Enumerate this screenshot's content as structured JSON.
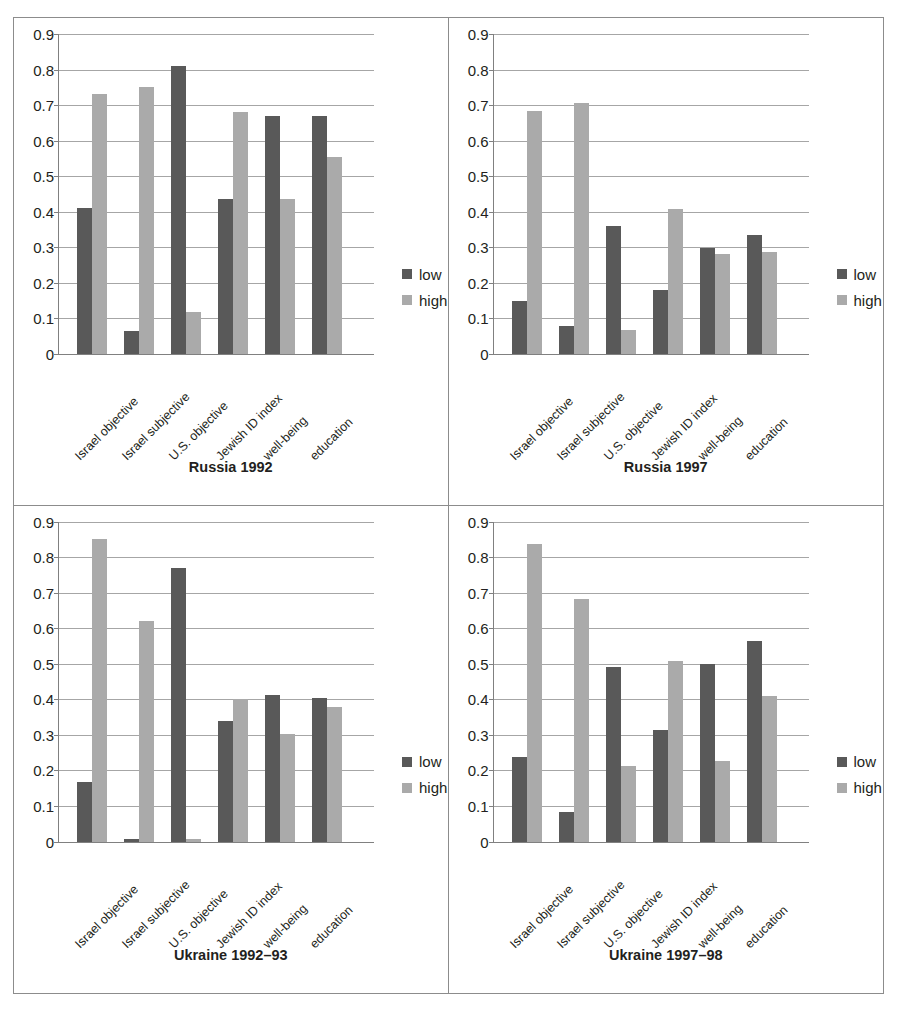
{
  "figure": {
    "categories": [
      "Israel objective",
      "Israel subjective",
      "U.S. objective",
      "Jewish ID index",
      "well-being",
      "education"
    ],
    "y_ticks": [
      "0.9",
      "0.8",
      "0.7",
      "0.6",
      "0.5",
      "0.4",
      "0.3",
      "0.2",
      "0.1",
      "0"
    ],
    "legend": {
      "low_label": "low",
      "high_label": "high"
    },
    "colors": {
      "low": "#595959",
      "high": "#aaaaaa",
      "gridline": "#a6a6a6",
      "axis": "#808080",
      "border": "#8c8c8c",
      "text": "#231f20"
    }
  },
  "chart_data": [
    {
      "type": "bar",
      "title": "Russia 1992",
      "xlabel": "",
      "ylabel": "",
      "ylim": [
        0,
        0.9
      ],
      "grid": true,
      "legend_position": "right",
      "categories": [
        "Israel objective",
        "Israel subjective",
        "U.S. objective",
        "Jewish ID index",
        "well-being",
        "education"
      ],
      "series": [
        {
          "name": "low",
          "values": [
            0.41,
            0.065,
            0.81,
            0.435,
            0.67,
            0.67
          ]
        },
        {
          "name": "high",
          "values": [
            0.73,
            0.752,
            0.118,
            0.68,
            0.435,
            0.555
          ]
        }
      ]
    },
    {
      "type": "bar",
      "title": "Russia 1997",
      "xlabel": "",
      "ylabel": "",
      "ylim": [
        0,
        0.9
      ],
      "grid": true,
      "legend_position": "right",
      "categories": [
        "Israel objective",
        "Israel subjective",
        "U.S. objective",
        "Jewish ID index",
        "well-being",
        "education"
      ],
      "series": [
        {
          "name": "low",
          "values": [
            0.148,
            0.08,
            0.36,
            0.18,
            0.298,
            0.335
          ]
        },
        {
          "name": "high",
          "values": [
            0.683,
            0.706,
            0.068,
            0.408,
            0.28,
            0.287
          ]
        }
      ]
    },
    {
      "type": "bar",
      "title": "Ukraine 1992–93",
      "xlabel": "",
      "ylabel": "",
      "ylim": [
        0,
        0.9
      ],
      "grid": true,
      "legend_position": "right",
      "categories": [
        "Israel objective",
        "Israel subjective",
        "U.S. objective",
        "Jewish ID index",
        "well-being",
        "education"
      ],
      "series": [
        {
          "name": "low",
          "values": [
            0.168,
            0.008,
            0.77,
            0.34,
            0.413,
            0.405
          ]
        },
        {
          "name": "high",
          "values": [
            0.85,
            0.62,
            0.008,
            0.4,
            0.302,
            0.377
          ]
        }
      ]
    },
    {
      "type": "bar",
      "title": "Ukraine 1997–98",
      "xlabel": "",
      "ylabel": "",
      "ylim": [
        0,
        0.9
      ],
      "grid": true,
      "legend_position": "right",
      "categories": [
        "Israel objective",
        "Israel subjective",
        "U.S. objective",
        "Jewish ID index",
        "well-being",
        "education"
      ],
      "series": [
        {
          "name": "low",
          "values": [
            0.238,
            0.082,
            0.49,
            0.315,
            0.5,
            0.565
          ]
        },
        {
          "name": "high",
          "values": [
            0.837,
            0.682,
            0.213,
            0.507,
            0.227,
            0.408
          ]
        }
      ]
    }
  ]
}
